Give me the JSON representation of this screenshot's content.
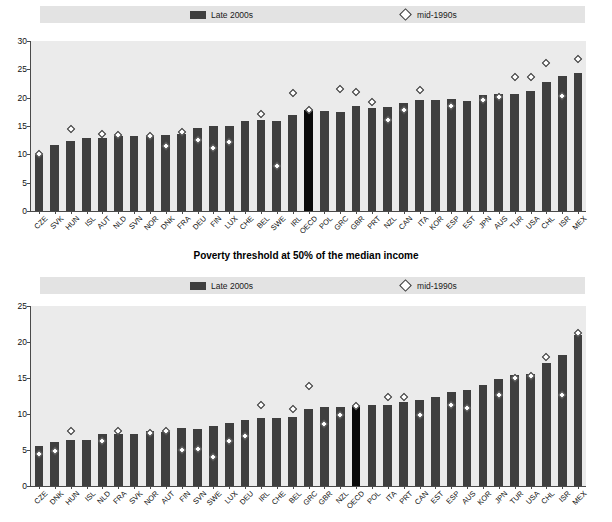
{
  "legend": {
    "late_label": "Late 2000s",
    "mid_label": "mid-1990s",
    "swatch_name": "late-2000s-bar-swatch",
    "marker_name": "mid-1990s-diamond-marker"
  },
  "middle_title": "Poverty threshold at 50% of the median income",
  "colors": {
    "bar": "#3f3f3f",
    "highlight_bar": "#0a0a0a",
    "plot_background": "#ebebeb",
    "legend_background": "#e3e3e3",
    "axis": "#4a4a4a",
    "marker_fill": "#ffffff"
  },
  "chart_data": [
    {
      "type": "bar",
      "id": "top-chart",
      "title": "",
      "xlabel": "",
      "ylabel": "",
      "ylim": [
        0,
        30
      ],
      "yticks": [
        0,
        5,
        10,
        15,
        20,
        25,
        30
      ],
      "grid": false,
      "legend_position": "top",
      "highlight_category": "OECD",
      "categories": [
        "CZE",
        "SVK",
        "HUN",
        "ISL",
        "AUT",
        "NLD",
        "SVN",
        "NOR",
        "DNK",
        "FRA",
        "DEU",
        "FIN",
        "LUX",
        "CHE",
        "BEL",
        "SWE",
        "IRL",
        "OECD",
        "POL",
        "GRC",
        "GBR",
        "PRT",
        "NZL",
        "CAN",
        "ITA",
        "KOR",
        "ESP",
        "EST",
        "JPN",
        "AUS",
        "TUR",
        "USA",
        "CHL",
        "ISR",
        "MEX"
      ],
      "series": [
        {
          "name": "Late 2000s",
          "values": [
            9.8,
            11.6,
            12.3,
            12.8,
            12.9,
            13.3,
            13.2,
            13.3,
            13.4,
            13.6,
            14.6,
            15.0,
            15.0,
            15.8,
            16.0,
            15.9,
            16.9,
            17.8,
            17.6,
            17.5,
            18.5,
            18.1,
            18.4,
            19.0,
            19.6,
            19.6,
            19.7,
            19.5,
            20.5,
            20.6,
            20.6,
            21.2,
            22.8,
            23.9,
            24.3
          ],
          "marker": "bar"
        },
        {
          "name": "mid-1990s",
          "values": [
            10.0,
            null,
            14.4,
            null,
            13.6,
            13.4,
            null,
            13.3,
            11.5,
            13.9,
            12.6,
            11.1,
            12.2,
            null,
            17.1,
            8.0,
            20.8,
            17.8,
            null,
            21.5,
            21.0,
            19.2,
            16.0,
            17.8,
            21.4,
            null,
            18.5,
            null,
            19.6,
            20.1,
            23.6,
            23.7,
            26.2,
            20.3,
            26.9
          ],
          "marker": "diamond"
        }
      ]
    },
    {
      "type": "bar",
      "id": "bottom-chart",
      "title": "Poverty threshold at 50% of the median income",
      "xlabel": "",
      "ylabel": "",
      "ylim": [
        0,
        25
      ],
      "yticks": [
        0,
        5,
        10,
        15,
        20,
        25
      ],
      "grid": false,
      "legend_position": "top",
      "highlight_category": "OECD",
      "categories": [
        "CZE",
        "DNK",
        "HUN",
        "ISL",
        "NLD",
        "FRA",
        "SVK",
        "NOR",
        "AUT",
        "FIN",
        "SVN",
        "SWE",
        "LUX",
        "DEU",
        "IRL",
        "CHE",
        "BEL",
        "GRC",
        "GBR",
        "NZL",
        "OECD",
        "POL",
        "ITA",
        "PRT",
        "CAN",
        "EST",
        "ESP",
        "AUS",
        "KOR",
        "JPN",
        "TUR",
        "USA",
        "CHL",
        "ISR",
        "MEX"
      ],
      "series": [
        {
          "name": "Late 2000s",
          "values": [
            5.5,
            6.1,
            6.4,
            6.4,
            7.2,
            7.2,
            7.2,
            7.7,
            7.5,
            8.0,
            7.9,
            8.4,
            8.8,
            9.1,
            9.4,
            9.4,
            9.6,
            10.7,
            11.0,
            11.0,
            11.1,
            11.2,
            11.3,
            11.6,
            12.0,
            12.4,
            13.0,
            13.3,
            14.0,
            14.9,
            15.4,
            15.6,
            17.1,
            18.2,
            21.0
          ],
          "marker": "bar"
        },
        {
          "name": "mid-1990s",
          "values": [
            4.4,
            4.8,
            7.7,
            null,
            6.3,
            7.6,
            null,
            7.4,
            7.6,
            5.0,
            5.2,
            4.0,
            6.3,
            7.0,
            11.2,
            null,
            10.7,
            13.9,
            8.6,
            9.9,
            11.1,
            null,
            12.3,
            12.4,
            9.9,
            null,
            11.2,
            10.8,
            null,
            12.6,
            15.0,
            15.3,
            17.9,
            12.7,
            21.3
          ],
          "marker": "diamond"
        }
      ]
    }
  ]
}
